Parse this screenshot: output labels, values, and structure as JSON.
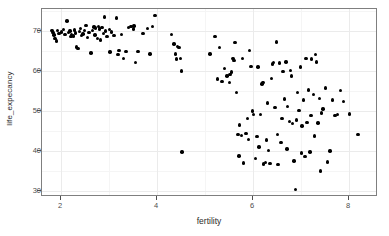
{
  "chart_data": {
    "type": "scatter",
    "title": "",
    "xlabel": "fertility",
    "ylabel": "life_expecancy",
    "xlim": [
      1.6,
      8.6
    ],
    "ylim": [
      28.5,
      75.5
    ],
    "xticks": [
      2,
      4,
      6,
      8
    ],
    "yticks": [
      30,
      40,
      50,
      60,
      70
    ],
    "xtick_labels": [
      "2",
      "4",
      "6",
      "8"
    ],
    "ytick_labels": [
      "30",
      "40",
      "50",
      "60",
      "70"
    ],
    "grid": true,
    "legend": "none",
    "point_color": "#000000",
    "panel_background": "#ffffff",
    "grid_color": "#ebebeb",
    "border_color": "#7f7f7f",
    "points": [
      [
        1.81,
        70.2
      ],
      [
        1.83,
        69.7
      ],
      [
        1.85,
        69.0
      ],
      [
        1.87,
        68.2
      ],
      [
        1.9,
        67.5
      ],
      [
        1.92,
        70.1
      ],
      [
        1.95,
        69.4
      ],
      [
        2.0,
        69.8
      ],
      [
        2.05,
        70.4
      ],
      [
        2.08,
        69.2
      ],
      [
        2.12,
        72.5
      ],
      [
        2.15,
        69.6
      ],
      [
        2.18,
        70.0
      ],
      [
        2.2,
        68.6
      ],
      [
        2.22,
        69.1
      ],
      [
        2.25,
        68.8
      ],
      [
        2.28,
        70.3
      ],
      [
        2.3,
        69.5
      ],
      [
        2.32,
        66.0
      ],
      [
        2.35,
        65.6
      ],
      [
        2.38,
        69.9
      ],
      [
        2.4,
        70.6
      ],
      [
        2.42,
        68.9
      ],
      [
        2.45,
        69.3
      ],
      [
        2.48,
        70.1
      ],
      [
        2.52,
        71.4
      ],
      [
        2.55,
        68.4
      ],
      [
        2.58,
        69.7
      ],
      [
        2.62,
        64.5
      ],
      [
        2.65,
        70.2
      ],
      [
        2.68,
        71.0
      ],
      [
        2.7,
        69.0
      ],
      [
        2.72,
        70.8
      ],
      [
        2.75,
        68.1
      ],
      [
        2.78,
        71.2
      ],
      [
        2.8,
        70.5
      ],
      [
        2.82,
        67.8
      ],
      [
        2.85,
        70.9
      ],
      [
        2.88,
        69.4
      ],
      [
        2.9,
        73.5
      ],
      [
        2.92,
        70.0
      ],
      [
        2.95,
        68.7
      ],
      [
        3.0,
        70.4
      ],
      [
        3.02,
        64.8
      ],
      [
        3.05,
        69.8
      ],
      [
        3.1,
        68.9
      ],
      [
        3.15,
        73.3
      ],
      [
        3.18,
        64.2
      ],
      [
        3.2,
        65.1
      ],
      [
        3.25,
        69.2
      ],
      [
        3.3,
        63.2
      ],
      [
        3.35,
        64.9
      ],
      [
        3.4,
        70.9
      ],
      [
        3.45,
        71.1
      ],
      [
        3.5,
        70.5
      ],
      [
        3.52,
        71.3
      ],
      [
        3.55,
        62.2
      ],
      [
        3.6,
        64.9
      ],
      [
        3.7,
        69.4
      ],
      [
        3.8,
        70.6
      ],
      [
        3.85,
        64.3
      ],
      [
        3.9,
        71.1
      ],
      [
        3.95,
        73.9
      ],
      [
        4.3,
        69.1
      ],
      [
        4.35,
        66.8
      ],
      [
        4.38,
        64.3
      ],
      [
        4.4,
        63.0
      ],
      [
        4.42,
        66.1
      ],
      [
        4.45,
        65.9
      ],
      [
        4.48,
        63.2
      ],
      [
        4.5,
        60.0
      ],
      [
        4.52,
        39.8
      ],
      [
        5.1,
        64.3
      ],
      [
        5.2,
        68.6
      ],
      [
        5.25,
        58.0
      ],
      [
        5.3,
        65.9
      ],
      [
        5.35,
        57.4
      ],
      [
        5.4,
        60.6
      ],
      [
        5.45,
        58.8
      ],
      [
        5.5,
        57.2
      ],
      [
        5.52,
        59.1
      ],
      [
        5.55,
        59.8
      ],
      [
        5.58,
        63.2
      ],
      [
        5.6,
        62.7
      ],
      [
        5.62,
        67.2
      ],
      [
        5.65,
        54.6
      ],
      [
        5.68,
        44.2
      ],
      [
        5.7,
        38.8
      ],
      [
        5.72,
        46.5
      ],
      [
        5.75,
        43.9
      ],
      [
        5.78,
        63.1
      ],
      [
        5.8,
        37.0
      ],
      [
        5.85,
        44.4
      ],
      [
        5.88,
        48.2
      ],
      [
        5.9,
        42.9
      ],
      [
        5.92,
        65.1
      ],
      [
        5.95,
        61.2
      ],
      [
        5.98,
        50.0
      ],
      [
        6.0,
        49.2
      ],
      [
        6.05,
        38.2
      ],
      [
        6.08,
        43.6
      ],
      [
        6.1,
        61.0
      ],
      [
        6.12,
        41.0
      ],
      [
        6.15,
        49.1
      ],
      [
        6.18,
        56.8
      ],
      [
        6.2,
        57.1
      ],
      [
        6.22,
        36.8
      ],
      [
        6.25,
        37.1
      ],
      [
        6.28,
        42.8
      ],
      [
        6.3,
        52.0
      ],
      [
        6.32,
        40.2
      ],
      [
        6.35,
        36.9
      ],
      [
        6.38,
        58.2
      ],
      [
        6.4,
        61.8
      ],
      [
        6.42,
        62.2
      ],
      [
        6.45,
        50.9
      ],
      [
        6.48,
        67.3
      ],
      [
        6.5,
        44.1
      ],
      [
        6.52,
        36.6
      ],
      [
        6.55,
        62.0
      ],
      [
        6.58,
        42.1
      ],
      [
        6.6,
        48.2
      ],
      [
        6.62,
        59.9
      ],
      [
        6.65,
        53.0
      ],
      [
        6.68,
        62.3
      ],
      [
        6.7,
        40.5
      ],
      [
        6.72,
        51.1
      ],
      [
        6.75,
        47.4
      ],
      [
        6.78,
        60.2
      ],
      [
        6.8,
        58.8
      ],
      [
        6.82,
        46.9
      ],
      [
        6.85,
        37.5
      ],
      [
        6.88,
        30.4
      ],
      [
        6.9,
        47.8
      ],
      [
        6.92,
        54.6
      ],
      [
        6.95,
        50.2
      ],
      [
        6.98,
        61.0
      ],
      [
        7.0,
        39.5
      ],
      [
        7.02,
        46.3
      ],
      [
        7.05,
        52.8
      ],
      [
        7.08,
        38.6
      ],
      [
        7.1,
        63.2
      ],
      [
        7.12,
        47.1
      ],
      [
        7.15,
        55.3
      ],
      [
        7.18,
        39.8
      ],
      [
        7.2,
        48.9
      ],
      [
        7.22,
        63.0
      ],
      [
        7.25,
        54.1
      ],
      [
        7.28,
        43.8
      ],
      [
        7.3,
        64.2
      ],
      [
        7.32,
        62.3
      ],
      [
        7.35,
        47.0
      ],
      [
        7.38,
        53.2
      ],
      [
        7.4,
        35.0
      ],
      [
        7.42,
        49.5
      ],
      [
        7.45,
        50.5
      ],
      [
        7.5,
        55.8
      ],
      [
        7.55,
        37.3
      ],
      [
        7.6,
        40.0
      ],
      [
        7.65,
        52.8
      ],
      [
        7.7,
        48.9
      ],
      [
        7.75,
        49.1
      ],
      [
        7.82,
        55.2
      ],
      [
        7.88,
        52.4
      ],
      [
        8.0,
        49.3
      ],
      [
        8.18,
        44.2
      ]
    ]
  }
}
